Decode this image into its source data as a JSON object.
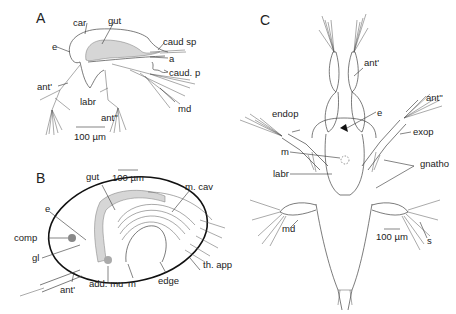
{
  "figure": {
    "panels": [
      {
        "id": "A",
        "label": "A",
        "scale_bar": "100 µm",
        "labels": {
          "car": "car",
          "gut": "gut",
          "e": "e",
          "caud_sp": "caud  sp",
          "a": "a",
          "caud_p": "caud. p",
          "ant1": "ant'",
          "labr": "labr",
          "md": "md",
          "ant2": "ant''"
        }
      },
      {
        "id": "B",
        "label": "B",
        "scale_bar": "100 µm",
        "labels": {
          "gut": "gut",
          "m_cav": "m. cav",
          "e": "e",
          "comp": "comp",
          "gl": "gl",
          "th_app": "th. app",
          "ant1": "ant'",
          "add_mu": "add. mu",
          "m": "m",
          "edge": "edge"
        }
      },
      {
        "id": "C",
        "label": "C",
        "scale_bar": "100 µm",
        "labels": {
          "ant1": "ant'",
          "ant2": "ant''",
          "e": "e",
          "endop": "endop",
          "exop": "exop",
          "m": "m",
          "gnatho": "gnatho",
          "labr": "labr",
          "md": "md",
          "s": "s"
        }
      }
    ]
  }
}
